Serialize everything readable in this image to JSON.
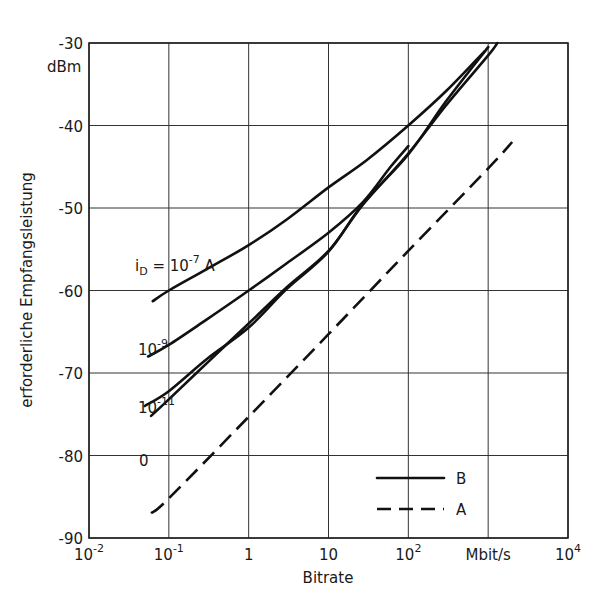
{
  "chart_data": {
    "type": "line",
    "title": "",
    "xlabel": "Bitrate",
    "x_unit": "Mbit/s",
    "ylabel": "erforderliche Empfangsleistung",
    "y_unit": "dBm",
    "x_scale": "log",
    "xlim": [
      0.01,
      10000
    ],
    "ylim": [
      -90,
      -30
    ],
    "grid": true,
    "x_ticks": [
      {
        "value": 0.01,
        "base": "10",
        "exp": "-2"
      },
      {
        "value": 0.1,
        "base": "10",
        "exp": "-1"
      },
      {
        "value": 1,
        "base": "1",
        "exp": ""
      },
      {
        "value": 10,
        "base": "10",
        "exp": ""
      },
      {
        "value": 100,
        "base": "10",
        "exp": "2"
      },
      {
        "value": 1000,
        "base": "Mbit/s",
        "exp": ""
      },
      {
        "value": 10000,
        "base": "10",
        "exp": "4"
      }
    ],
    "y_ticks": [
      -30,
      -40,
      -50,
      -60,
      -70,
      -80,
      -90
    ],
    "y_tick_labels": [
      "-30",
      "-40",
      "-50",
      "-60",
      "-70",
      "-80",
      "-90"
    ],
    "legend": {
      "position": "lower right",
      "entries": [
        {
          "label": "B",
          "style": "solid"
        },
        {
          "label": "A",
          "style": "dashed"
        }
      ]
    },
    "series": [
      {
        "name": "B, i_D = 10^-7 A",
        "style": "solid",
        "annotation": {
          "text": "i",
          "sub": "D",
          "mid": " = 10",
          "sup": "-7",
          "tail": " A"
        },
        "x": [
          0.063,
          0.1,
          0.3,
          1,
          3,
          10,
          30,
          100,
          300,
          900
        ],
        "y": [
          -61.3,
          -60.0,
          -57.4,
          -54.5,
          -51.4,
          -47.5,
          -44.2,
          -40.0,
          -35.8,
          -31.0
        ]
      },
      {
        "name": "B, i_D = 10^-9 A",
        "style": "solid",
        "annotation": {
          "text": "10",
          "sup": "-9"
        },
        "x": [
          0.055,
          0.1,
          0.3,
          1,
          3,
          10,
          27,
          60,
          100
        ],
        "y": [
          -68.0,
          -66.6,
          -63.5,
          -60.0,
          -56.7,
          -53.0,
          -49.3,
          -45.0,
          -42.5
        ]
      },
      {
        "name": "B, i_D = 10^-11 A",
        "style": "solid",
        "annotation": {
          "text": "10",
          "sup": "-11"
        },
        "x": [
          0.05,
          0.1,
          0.3,
          1,
          3,
          10,
          27,
          100,
          300,
          1000
        ],
        "y": [
          -74.0,
          -72.2,
          -68.3,
          -64.5,
          -59.8,
          -55.3,
          -49.5,
          -43.5,
          -37.0,
          -30.5
        ]
      },
      {
        "name": "B, i_D = 0",
        "style": "solid",
        "annotation": {
          "text": "0",
          "sup": ""
        },
        "x": [
          0.06,
          0.1,
          0.3,
          1,
          3,
          10,
          27,
          100,
          300,
          1000,
          1300
        ],
        "y": [
          -75.2,
          -73.2,
          -68.8,
          -64.0,
          -59.6,
          -55.2,
          -49.6,
          -43.4,
          -37.5,
          -31.5,
          -30.0
        ]
      },
      {
        "name": "A",
        "style": "dashed",
        "x": [
          0.06,
          0.1,
          1,
          10,
          100,
          1000,
          2000
        ],
        "y": [
          -87.0,
          -85.2,
          -75.3,
          -65.3,
          -55.2,
          -45.2,
          -42.0
        ]
      }
    ]
  },
  "annotations": {
    "y_unit_label": "dBm",
    "x_unit_label": "Mbit/s",
    "curve_labels": [
      "i_D = 10^-7 A",
      "10^-9",
      "10^-11",
      "0"
    ]
  }
}
